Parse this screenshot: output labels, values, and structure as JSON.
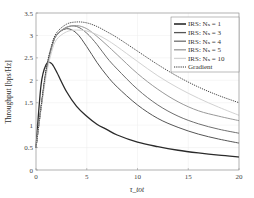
{
  "chart_data": {
    "type": "line",
    "title": "",
    "xlabel": "τ_tot",
    "ylabel": "Throughput [bps/Hz]",
    "xlim": [
      0,
      20
    ],
    "ylim": [
      0,
      3.5
    ],
    "xticks": [
      0,
      5,
      10,
      15,
      20
    ],
    "yticks": [
      0,
      0.5,
      1,
      1.5,
      2,
      2.5,
      3,
      3.5
    ],
    "grid": true,
    "legend_position": "upper right",
    "x": [
      0,
      0.5,
      1,
      1.5,
      2,
      3,
      4,
      5,
      6,
      7,
      8,
      10,
      12,
      14,
      16,
      18,
      20
    ],
    "series": [
      {
        "name": "IRS: N_s = 1",
        "color": "#2a2a2a",
        "width": 1.3,
        "dash": "",
        "values": [
          0.5,
          1.9,
          2.35,
          2.38,
          2.2,
          1.75,
          1.42,
          1.2,
          1.02,
          0.9,
          0.78,
          0.62,
          0.52,
          0.44,
          0.38,
          0.33,
          0.29
        ]
      },
      {
        "name": "IRS: N_s = 3",
        "color": "#555555",
        "width": 1.0,
        "dash": "",
        "values": [
          0.5,
          1.4,
          2.2,
          2.7,
          3.0,
          3.15,
          3.05,
          2.75,
          2.4,
          2.1,
          1.85,
          1.45,
          1.15,
          0.95,
          0.8,
          0.69,
          0.6
        ]
      },
      {
        "name": "IRS: N_s = 4",
        "color": "#6f6f6f",
        "width": 1.0,
        "dash": "",
        "values": [
          0.5,
          1.4,
          2.2,
          2.7,
          3.0,
          3.18,
          3.2,
          3.05,
          2.8,
          2.5,
          2.25,
          1.8,
          1.45,
          1.2,
          1.03,
          0.91,
          0.82
        ]
      },
      {
        "name": "IRS: N_s = 5",
        "color": "#999999",
        "width": 1.0,
        "dash": "",
        "values": [
          0.5,
          1.4,
          2.2,
          2.7,
          3.0,
          3.18,
          3.22,
          3.15,
          2.98,
          2.78,
          2.57,
          2.15,
          1.8,
          1.52,
          1.32,
          1.2,
          1.1
        ]
      },
      {
        "name": "IRS: N_s = 10",
        "color": "#d2d2d2",
        "width": 1.0,
        "dash": "",
        "values": [
          0.5,
          1.35,
          2.1,
          2.6,
          2.9,
          3.08,
          3.12,
          3.1,
          3.02,
          2.9,
          2.75,
          2.42,
          2.1,
          1.83,
          1.6,
          1.4,
          1.22
        ]
      },
      {
        "name": "Gradient",
        "color": "#333333",
        "width": 0.9,
        "dash": "1.2,1",
        "values": [
          0.5,
          1.4,
          2.25,
          2.75,
          3.05,
          3.25,
          3.3,
          3.28,
          3.2,
          3.08,
          2.95,
          2.65,
          2.35,
          2.08,
          1.85,
          1.66,
          1.5
        ]
      }
    ]
  }
}
